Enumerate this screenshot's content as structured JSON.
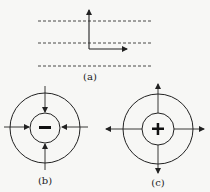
{
  "figure": {
    "panels": [
      {
        "id": "a",
        "label": "(a)",
        "description": "three dashed parallel lines with perpendicular axes arrows"
      },
      {
        "id": "b",
        "label": "(b)",
        "sign": "−",
        "arrows": "inward"
      },
      {
        "id": "c",
        "label": "(c)",
        "sign": "+",
        "arrows": "outward"
      }
    ]
  },
  "colors": {
    "stroke": "#222222",
    "background": "#f7f7f5"
  }
}
